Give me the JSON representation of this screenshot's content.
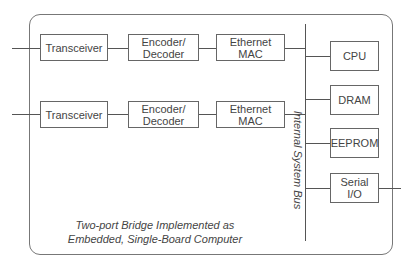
{
  "diagram": {
    "ports": [
      {
        "transceiver": "Transceiver",
        "encoder": "Encoder/\nDecoder",
        "mac": "Ethernet\nMAC"
      },
      {
        "transceiver": "Transceiver",
        "encoder": "Encoder/\nDecoder",
        "mac": "Ethernet\nMAC"
      }
    ],
    "bus_label": "Internal System Bus",
    "peripherals": [
      "CPU",
      "DRAM",
      "EEPROM",
      "Serial\nI/O"
    ],
    "caption_line1": "Two-port Bridge Implemented as",
    "caption_line2": "Embedded, Single-Board Computer"
  }
}
